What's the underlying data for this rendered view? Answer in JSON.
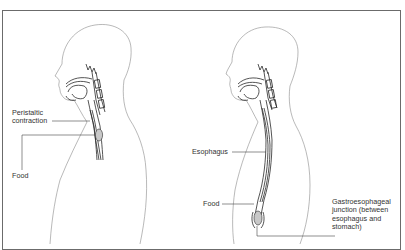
{
  "figure": {
    "panels": [
      {
        "id": "peristalsis",
        "labels": {
          "peristaltic_line1": "Peristaltic",
          "peristaltic_line2": "contraction",
          "food": "Food"
        }
      },
      {
        "id": "esophagus-anatomy",
        "labels": {
          "esophagus": "Esophagus",
          "food": "Food",
          "gej_line1": "Gastroesophageal",
          "gej_line2": "junction (between",
          "gej_line3": "esophagus and",
          "gej_line4": "stomach)"
        }
      }
    ],
    "colors": {
      "outline": "#8a8a8a",
      "anatomy": "#2a2a2a",
      "leader": "#444444",
      "frame": "#6b6b6b",
      "food_fill": "#c8c8c8"
    }
  }
}
